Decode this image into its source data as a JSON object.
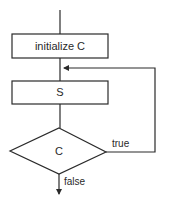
{
  "diagram": {
    "type": "flowchart",
    "title": "",
    "nodes": [
      {
        "id": "init",
        "shape": "rectangle",
        "label": "initialize C"
      },
      {
        "id": "body",
        "shape": "rectangle",
        "label": "S"
      },
      {
        "id": "cond",
        "shape": "diamond",
        "label": "C"
      }
    ],
    "edges": [
      {
        "from": "entry",
        "to": "init",
        "label": ""
      },
      {
        "from": "init",
        "to": "body",
        "label": ""
      },
      {
        "from": "body",
        "to": "cond",
        "label": ""
      },
      {
        "from": "cond",
        "to": "body",
        "label": "true"
      },
      {
        "from": "cond",
        "to": "exit",
        "label": "false"
      }
    ],
    "labels": {
      "true": "true",
      "false": "false"
    },
    "colors": {
      "stroke": "#2a2a2a",
      "fill": "#ffffff",
      "text": "#2a2a2a"
    }
  }
}
